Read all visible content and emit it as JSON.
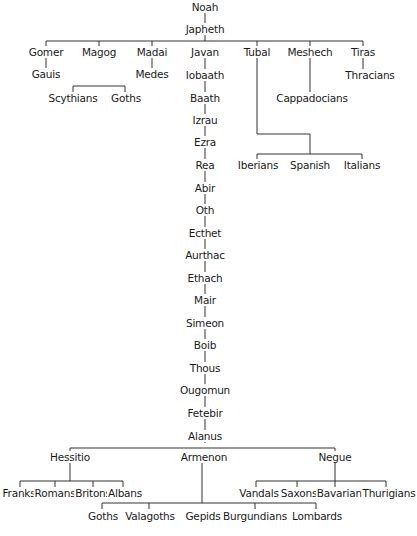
{
  "colors": {
    "line": "#333333",
    "text": "#1a1a1a",
    "background": "#ffffff"
  },
  "nodes": {
    "noah": "Noah",
    "japheth": "Japheth",
    "gomer": "Gomer",
    "magog": "Magog",
    "madai": "Madai",
    "javan": "Javan",
    "tubal": "Tubal",
    "meshech": "Meshech",
    "tiras": "Tiras",
    "gauis": "Gauis",
    "medes": "Medes",
    "thracians": "Thracians",
    "scythians": "Scythians",
    "goths_magog": "Goths",
    "cappadocians": "Cappadocians",
    "iberians": "Iberians",
    "spanish": "Spanish",
    "italians": "Italians",
    "iobaath": "Iobaath",
    "baath": "Baath",
    "izrau": "Izrau",
    "ezra": "Ezra",
    "rea": "Rea",
    "abir": "Abir",
    "oth": "Oth",
    "ecthet": "Ecthet",
    "aurthac": "Aurthac",
    "ethach": "Ethach",
    "mair": "Mair",
    "simeon": "Simeon",
    "boib": "Boib",
    "thous": "Thous",
    "ougomun": "Ougomun",
    "fetebir": "Fetebir",
    "alanus": "Alanus",
    "hessitio": "Hessitio",
    "armenon": "Armenon",
    "negue": "Negue",
    "franks": "Franks",
    "romans": "Romans",
    "britons": "Britons",
    "albans": "Albans",
    "vandals": "Vandals",
    "saxons": "Saxons",
    "bavarians": "Bavarians",
    "thurigians": "Thurigians",
    "goths_armenon": "Goths",
    "valagoths": "Valagoths",
    "gepids": "Gepids",
    "burgundians": "Burgundians",
    "lombards": "Lombards"
  }
}
